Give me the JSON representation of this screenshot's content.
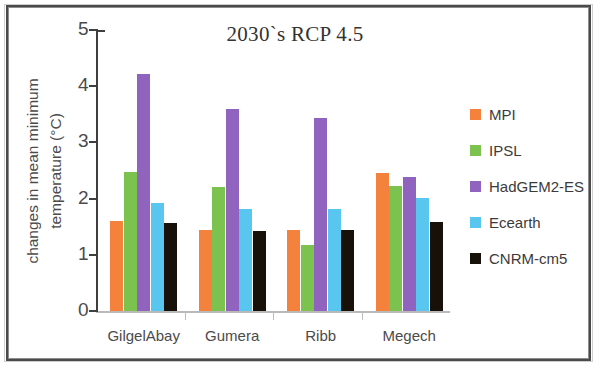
{
  "chart_data": {
    "type": "bar",
    "title": "2030`s RCP 4.5",
    "xlabel": "",
    "ylabel": "changes in mean minimum temperature (°C)",
    "ylabel_lines": [
      "changes in mean minimum",
      "temperature (°C)"
    ],
    "categories": [
      "GilgelAbay",
      "Gumera",
      "Ribb",
      "Megech"
    ],
    "ylim": [
      0,
      5
    ],
    "yticks": [
      0,
      1,
      2,
      3,
      4,
      5
    ],
    "ytick_labels": [
      "0",
      "1",
      "2",
      "3",
      "4",
      "5"
    ],
    "grid": false,
    "legend_position": "right",
    "series": [
      {
        "name": "MPI",
        "color": "#F4813C",
        "values": [
          1.6,
          1.44,
          1.45,
          2.45
        ]
      },
      {
        "name": "IPSL",
        "color": "#7CC24F",
        "values": [
          2.48,
          2.2,
          1.17,
          2.22
        ]
      },
      {
        "name": "HadGEM2-ES",
        "color": "#9063BF",
        "values": [
          4.21,
          3.6,
          3.43,
          2.38
        ]
      },
      {
        "name": "Ecearth",
        "color": "#58C6EE",
        "values": [
          1.92,
          1.82,
          1.81,
          2.01
        ]
      },
      {
        "name": "CNRM-cm5",
        "color": "#17110A",
        "values": [
          1.56,
          1.42,
          1.44,
          1.58
        ]
      }
    ]
  }
}
